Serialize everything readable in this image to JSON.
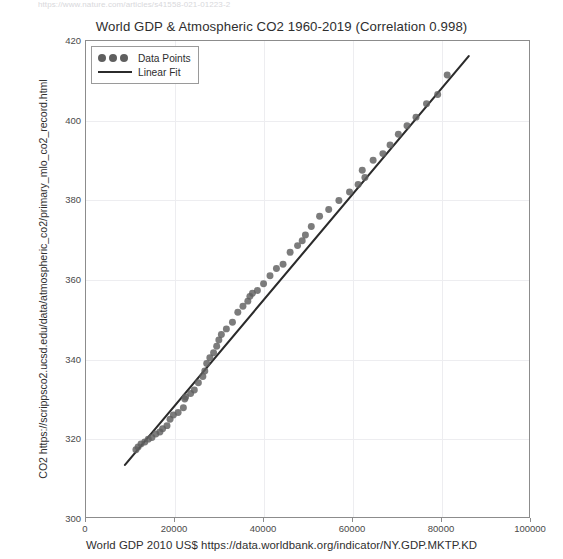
{
  "page": {
    "clipped_top_text": "https://www.nature.com/articles/s41558-021-01223-2"
  },
  "legend": {
    "position": "upper-left",
    "items": [
      {
        "label": "Data Points",
        "marker": "circles",
        "color": "#5f5f5f"
      },
      {
        "label": "Linear Fit",
        "marker": "line",
        "color": "#2b2b2b"
      }
    ]
  },
  "axes": {
    "y_ticks": [
      "300",
      "320",
      "340",
      "360",
      "380",
      "400",
      "420"
    ],
    "x_ticks": [
      "0",
      "20000",
      "40000",
      "60000",
      "80000",
      "100000"
    ]
  },
  "chart_data": {
    "type": "scatter",
    "title": "World GDP & Atmospheric CO2 1960-2019 (Correlation 0.998)",
    "xlabel": "World GDP 2010 US$ https://data.worldbank.org/indicator/NY.GDP.MKTP.KD",
    "ylabel": "CO2 https://scrippsco2.ucsd.edu/data/atmospheric_co2/primary_mlo_co2_record.html",
    "correlation": 0.998,
    "xlim": [
      0,
      100000
    ],
    "ylim": [
      300,
      420
    ],
    "grid": true,
    "legend_position": "upper left",
    "x_tick_values": [
      0,
      20000,
      40000,
      60000,
      80000,
      100000
    ],
    "y_tick_values": [
      300,
      320,
      340,
      360,
      380,
      400,
      420
    ],
    "series": [
      {
        "name": "Data Points",
        "type": "scatter",
        "color": "#5f5f5f",
        "marker_size": 7,
        "x": [
          11270,
          11760,
          12420,
          13280,
          14060,
          14880,
          15760,
          16680,
          17290,
          18280,
          18970,
          19720,
          20800,
          21980,
          22300,
          22480,
          23620,
          24450,
          25370,
          26380,
          26820,
          27250,
          27960,
          28800,
          29500,
          29990,
          30560,
          31690,
          33060,
          34270,
          35430,
          36530,
          37000,
          37580,
          38690,
          40080,
          41540,
          42990,
          44480,
          46080,
          47760,
          48810,
          49530,
          50860,
          52730,
          54790,
          57090,
          59490,
          61430,
          62960,
          62360,
          64820,
          67020,
          68640,
          70510,
          72470,
          74500,
          76870,
          79390,
          81540
        ],
        "y": [
          316.9,
          317.6,
          318.4,
          318.9,
          319.6,
          320.0,
          320.9,
          321.4,
          322.2,
          323.0,
          324.6,
          325.7,
          326.3,
          327.5,
          329.7,
          330.2,
          331.1,
          332.0,
          333.8,
          335.4,
          336.8,
          338.7,
          340.1,
          341.4,
          343.0,
          344.6,
          346.0,
          347.4,
          349.1,
          351.6,
          353.1,
          354.4,
          355.6,
          356.4,
          357.1,
          358.8,
          360.8,
          362.6,
          363.7,
          366.7,
          368.4,
          369.6,
          371.1,
          373.2,
          375.8,
          377.5,
          379.8,
          381.9,
          383.8,
          385.6,
          387.4,
          389.9,
          391.6,
          393.8,
          396.5,
          398.6,
          400.8,
          404.2,
          406.5,
          411.4
        ]
      },
      {
        "name": "Linear Fit",
        "type": "line",
        "color": "#2b2b2b",
        "slope": 0.001329,
        "intercept": 301.4,
        "x_endpoints": [
          8800,
          86400
        ],
        "y_endpoints": [
          313.1,
          416.2
        ]
      }
    ]
  }
}
